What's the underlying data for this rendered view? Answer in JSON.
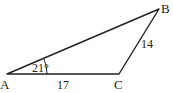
{
  "diagram": {
    "type": "triangle",
    "vertices": {
      "A": {
        "label": "A",
        "x": 7,
        "y": 74
      },
      "B": {
        "label": "B",
        "x": 159,
        "y": 9
      },
      "C": {
        "label": "C",
        "x": 119,
        "y": 74
      }
    },
    "angle_A": {
      "label": "21°"
    },
    "side_AC": {
      "label": "17"
    },
    "side_CB": {
      "label": "14"
    },
    "stroke_color": "#222222"
  }
}
